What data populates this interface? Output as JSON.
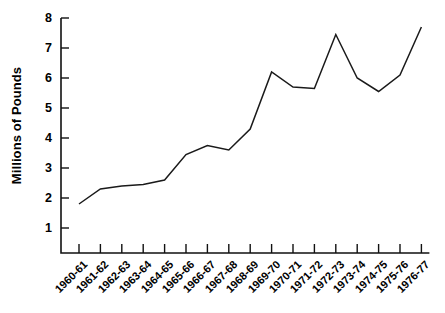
{
  "chart_data": {
    "type": "line",
    "title": "",
    "subtitle": "",
    "xlabel": "",
    "ylabel": "Millions of Pounds",
    "ylim": [
      0,
      8
    ],
    "ytick_values": [
      8,
      7,
      6,
      5,
      4,
      3,
      2,
      1
    ],
    "ytick_labels": [
      "8",
      "7",
      "6",
      "5",
      "4",
      "3",
      "2",
      "1"
    ],
    "grid": false,
    "legend": null,
    "legend_position": "none",
    "line_color": "#1a1a1a",
    "categories": [
      "1960-61",
      "1961-62",
      "1962-63",
      "1963-64",
      "1964-65",
      "1965-66",
      "1966-67",
      "1967-68",
      "1968-69",
      "1969-70",
      "1970-71",
      "1971-72",
      "1972-73",
      "1973-74",
      "1974-75",
      "1975-76",
      "1976-77"
    ],
    "values": [
      1.8,
      2.3,
      2.4,
      2.45,
      2.6,
      3.45,
      3.75,
      3.6,
      4.3,
      6.2,
      5.7,
      5.65,
      7.45,
      6.0,
      5.55,
      6.1,
      7.7
    ]
  }
}
